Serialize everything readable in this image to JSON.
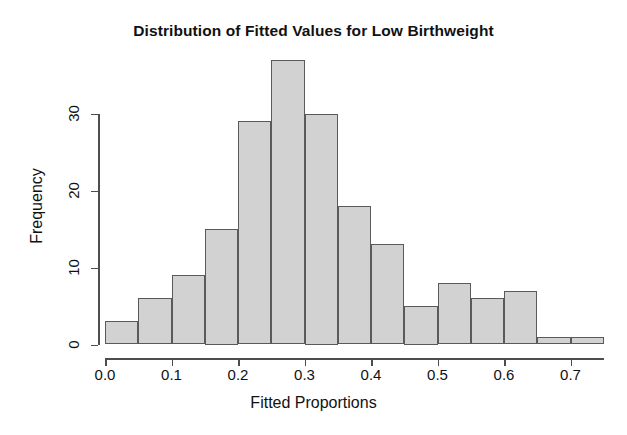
{
  "chart_data": {
    "type": "bar",
    "title": "Distribution of Fitted Values for Low Birthweight",
    "xlabel": "Fitted Proportions",
    "ylabel": "Frequency",
    "grid": false,
    "legend": "none",
    "bin_width": 0.05,
    "bin_edges": [
      0.0,
      0.05,
      0.1,
      0.15,
      0.2,
      0.25,
      0.3,
      0.35,
      0.4,
      0.45,
      0.5,
      0.55,
      0.6,
      0.65,
      0.7,
      0.75
    ],
    "categories": [
      "0.00-0.05",
      "0.05-0.10",
      "0.10-0.15",
      "0.15-0.20",
      "0.20-0.25",
      "0.25-0.30",
      "0.30-0.35",
      "0.35-0.40",
      "0.40-0.45",
      "0.45-0.50",
      "0.50-0.55",
      "0.55-0.60",
      "0.60-0.65",
      "0.65-0.70",
      "0.70-0.75"
    ],
    "x": [
      0.025,
      0.075,
      0.125,
      0.175,
      0.225,
      0.275,
      0.325,
      0.375,
      0.425,
      0.475,
      0.525,
      0.575,
      0.625,
      0.675,
      0.725
    ],
    "values": [
      3,
      6,
      9,
      15,
      29,
      37,
      30,
      18,
      13,
      5,
      8,
      6,
      7,
      1,
      1
    ],
    "xlim": [
      0.0,
      0.75
    ],
    "ylim": [
      0,
      37
    ],
    "xticks": [
      0.0,
      0.1,
      0.2,
      0.3,
      0.4,
      0.5,
      0.6,
      0.7
    ],
    "xticklabels": [
      "0.0",
      "0.1",
      "0.2",
      "0.3",
      "0.4",
      "0.5",
      "0.6",
      "0.7"
    ],
    "yticks": [
      0,
      10,
      20,
      30
    ],
    "yticklabels": [
      "0",
      "10",
      "20",
      "30"
    ],
    "bar_fill_color": "#d2d2d2",
    "bar_border_color": "#5a5a5a",
    "axis_color": "#4d4d4d",
    "background_color": "#ffffff"
  }
}
